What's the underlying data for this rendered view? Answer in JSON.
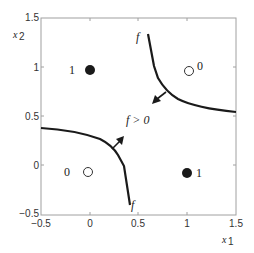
{
  "axes": {
    "xlabel": "x",
    "xlabel_sub": "1",
    "ylabel": "x",
    "ylabel_sub": "2",
    "xlim": [
      -0.5,
      1.5
    ],
    "ylim": [
      -0.5,
      1.5
    ],
    "xticks": [
      "−0.5",
      "0",
      "0.5",
      "1",
      "1.5"
    ],
    "yticks": [
      "−0.5",
      "0",
      "0.5",
      "1",
      "1.5"
    ]
  },
  "points": [
    {
      "x": 0,
      "y": 1,
      "filled": true,
      "label": "1"
    },
    {
      "x": 1,
      "y": 1,
      "filled": false,
      "label": "0"
    },
    {
      "x": 0,
      "y": 0,
      "filled": false,
      "label": "0"
    },
    {
      "x": 1,
      "y": 0,
      "filled": true,
      "label": "1"
    }
  ],
  "curves": {
    "upper_label": "f",
    "lower_label": "f"
  },
  "region_label": "f > 0",
  "colors": {
    "line": "#1a1a1a",
    "axis": "#9a9a9a"
  }
}
